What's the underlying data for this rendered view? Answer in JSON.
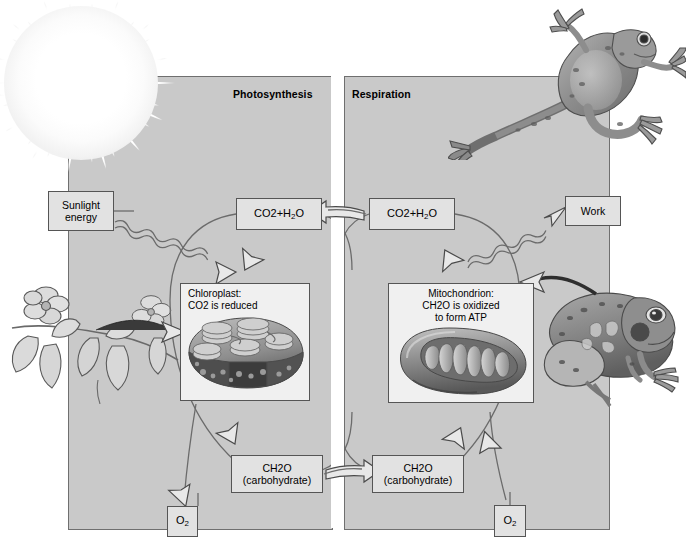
{
  "figure": {
    "panels": [
      {
        "id": "photosynthesis",
        "title": "Photosynthesis"
      },
      {
        "id": "respiration",
        "title": "Respiration"
      }
    ],
    "labels": {
      "sunlight_energy": "Sunlight\nenergy",
      "sunlight_line1": "Sunlight",
      "sunlight_line2": "energy",
      "work": "Work",
      "co2_h2o_left_formula": "CO2+H2O",
      "co2_h2o_right_formula": "CO2+H2O",
      "ch2o_left_formula": "CH2O",
      "ch2o_left_sub": "(carbohydrate)",
      "ch2o_right_formula": "CH2O",
      "ch2o_right_sub": "(carbohydrate)",
      "o2_left": "O2",
      "o2_right": "O2"
    },
    "organelles": [
      {
        "id": "chloroplast",
        "caption_line1": "Chloroplast:",
        "caption_line2": "CO2 is reduced",
        "image_name": "chloroplast-illustration"
      },
      {
        "id": "mitochondrion",
        "caption_line1": "Mitochondrion:",
        "caption_line2": "CH2O is oxidized",
        "caption_line3": "to form ATP",
        "image_name": "mitochondrion-illustration"
      }
    ],
    "illustrations": [
      {
        "name": "sun-illustration",
        "description": "Sun with radiating glow"
      },
      {
        "name": "plant-illustration",
        "description": "Flowering plant branch"
      },
      {
        "name": "frog-leaping-illustration",
        "description": "Leaping frog"
      },
      {
        "name": "frog-sitting-illustration",
        "description": "Sitting frog"
      }
    ],
    "colors": {
      "panel_fill": "#c9c9c9",
      "panel_border": "#6f6f6f",
      "box_fill": "#e2e2e2",
      "box_border": "#555555",
      "arrow_fill": "#e8e8e8",
      "arrow_stroke": "#4a4a4a",
      "page_background": "#ffffff"
    }
  }
}
